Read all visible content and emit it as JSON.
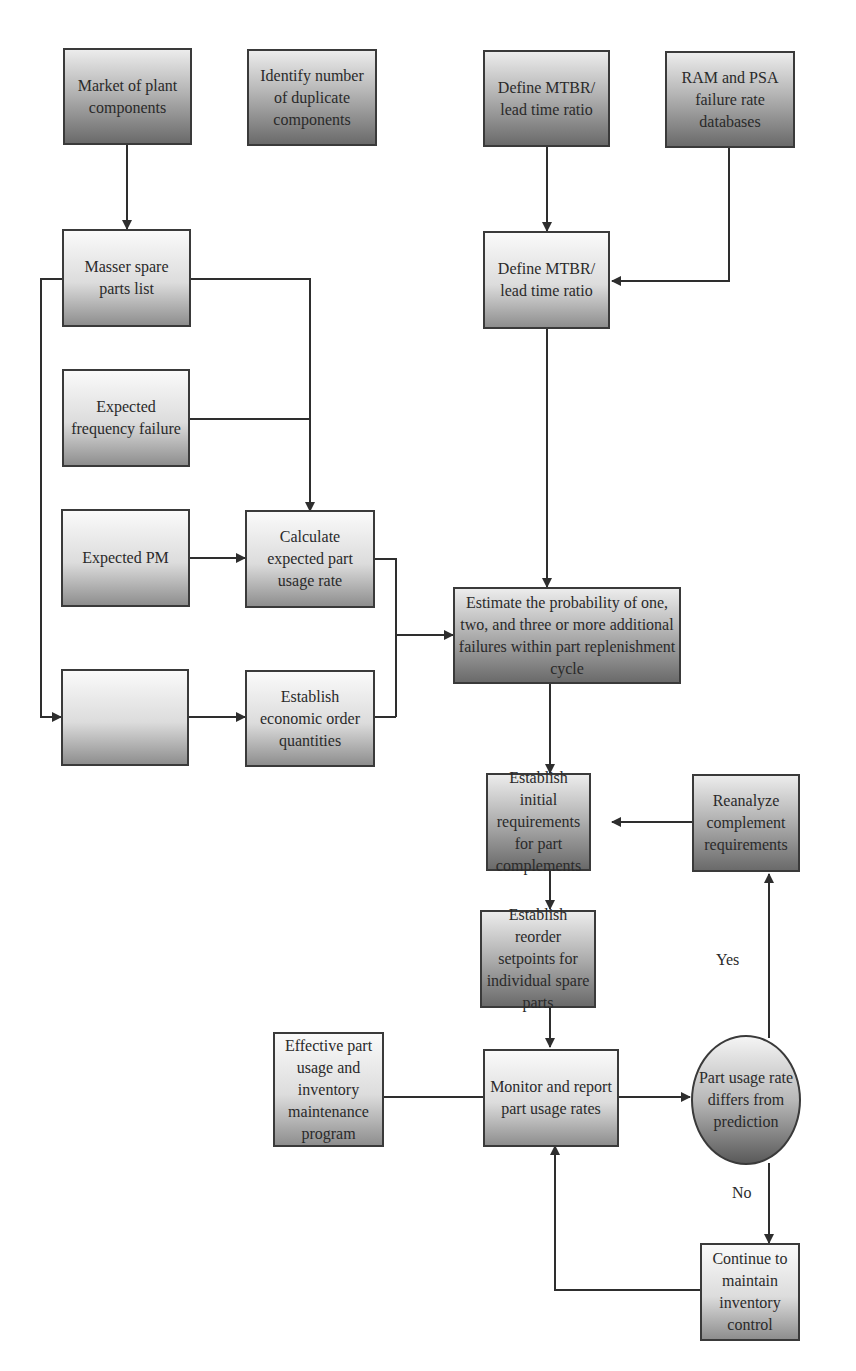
{
  "nodes": {
    "market": "Market of plant components",
    "identify_duplicates": "Identify number of duplicate components",
    "define_mtbr_top": "Define MTBR/ lead time ratio",
    "ram_psa": "RAM and PSA failure rate databases",
    "master_list": "Masser spare parts list",
    "define_mtbr_mid": "Define MTBR/ lead time ratio",
    "expected_frequency": "Expected frequency failure",
    "expected_pm": "Expected PM",
    "calculate_usage": "Calculate expected part usage rate",
    "blank_box": "",
    "establish_eoq": "Establish economic order quantities",
    "estimate_probability": "Estimate the probability of one, two, and three or more additional failures within part replenishment cycle",
    "establish_initial": "Establish initial requirements for part complements",
    "reanalyze": "Reanalyze complement requirements",
    "reorder_setpoints": "Establish reorder setpoints for individual spare parts",
    "effective_program": "Effective part usage and inventory maintenance program",
    "monitor_report": "Monitor and report part usage rates",
    "decision": "Part usage rate differs from prediction",
    "continue_control": "Continue to maintain inventory control"
  },
  "edge_labels": {
    "yes": "Yes",
    "no": "No"
  }
}
